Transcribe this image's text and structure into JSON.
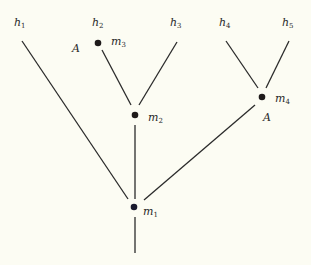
{
  "diagram": {
    "type": "tree",
    "background": "#fcfcf3",
    "leaves": [
      {
        "id": "h1",
        "base": "h",
        "sub": "1"
      },
      {
        "id": "h2",
        "base": "h",
        "sub": "2"
      },
      {
        "id": "h3",
        "base": "h",
        "sub": "3"
      },
      {
        "id": "h4",
        "base": "h",
        "sub": "4"
      },
      {
        "id": "h5",
        "base": "h",
        "sub": "5"
      }
    ],
    "nodes": [
      {
        "id": "m1",
        "base": "m",
        "sub": "1"
      },
      {
        "id": "m2",
        "base": "m",
        "sub": "2"
      },
      {
        "id": "m3",
        "base": "m",
        "sub": "3",
        "annotation": "A"
      },
      {
        "id": "m4",
        "base": "m",
        "sub": "4",
        "annotation": "A"
      }
    ],
    "edges": [
      {
        "from": "h1",
        "to": "m1"
      },
      {
        "from": "m3",
        "to": "m2"
      },
      {
        "from": "h3",
        "to": "m2"
      },
      {
        "from": "m2",
        "to": "m1"
      },
      {
        "from": "h4",
        "to": "m4"
      },
      {
        "from": "h5",
        "to": "m4"
      },
      {
        "from": "m4",
        "to": "m1"
      },
      {
        "from": "m1",
        "to": "root"
      }
    ]
  }
}
